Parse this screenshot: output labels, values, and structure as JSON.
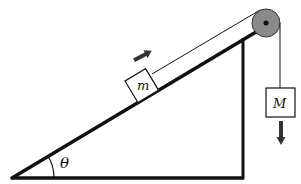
{
  "diagram": {
    "type": "physics-incline-pulley",
    "colors": {
      "line": "#111111",
      "pulley_fill": "#8a8a8a",
      "arrow": "#333333",
      "background": "#ffffff"
    },
    "labels": {
      "block_on_incline": "m",
      "hanging_block": "M",
      "angle": "θ"
    },
    "arrows": {
      "block_m_direction": "up-slope",
      "block_M_direction": "down"
    }
  }
}
